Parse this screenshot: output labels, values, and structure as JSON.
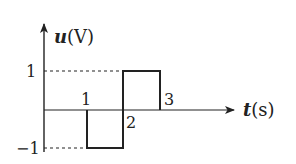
{
  "diagram": {
    "type": "piecewise-waveform",
    "y_axis": {
      "variable": "u",
      "unit": "(V)"
    },
    "x_axis": {
      "variable": "t",
      "unit": "(s)"
    },
    "y_ticks": [
      {
        "value": 1,
        "label": "1"
      },
      {
        "value": -1,
        "label": "−1"
      }
    ],
    "x_ticks": [
      {
        "value": 1,
        "label": "1"
      },
      {
        "value": 2,
        "label": "2"
      },
      {
        "value": 3,
        "label": "3"
      }
    ],
    "segments": [
      {
        "t_start": 0,
        "t_end": 1,
        "u": 0
      },
      {
        "t_start": 1,
        "t_end": 2,
        "u": -1
      },
      {
        "t_start": 2,
        "t_end": 3,
        "u": 1
      },
      {
        "t_start": 3,
        "t_end": null,
        "u": 0
      }
    ],
    "colors": {
      "line": "#222222",
      "background": "#ffffff"
    }
  }
}
